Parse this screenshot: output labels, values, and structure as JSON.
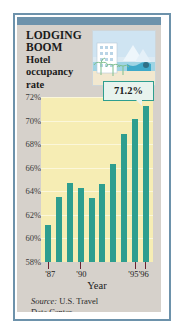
{
  "card": {
    "title_line1": "LODGING",
    "title_line2": "BOOM",
    "subtitle_line1": "Hotel",
    "subtitle_line2": "occupancy",
    "subtitle_line3": "rate",
    "illustration_name": "hotel-beach-illustration",
    "callout_value": "71.2%",
    "source_prefix": "Source:",
    "source_text": "U.S. Travel",
    "source_text2": "Data Center"
  },
  "colors": {
    "bar": "#2e9e8f",
    "plot_background": "#f6edb4",
    "card_background": "#d6d1cb",
    "frame": "#6d92ab",
    "gridline": "#fbf7da",
    "tick": "#6b2230",
    "callout_background": "#e8f3ee"
  },
  "chart_data": {
    "type": "bar",
    "title": "LODGING BOOM",
    "subtitle": "Hotel occupancy rate",
    "xlabel": "Year",
    "ylabel": "",
    "categories": [
      "'87",
      "'88",
      "'89",
      "'90",
      "'91",
      "'92",
      "'93",
      "'94",
      "'95",
      "'96"
    ],
    "values": [
      61.1,
      63.5,
      64.7,
      64.3,
      63.4,
      64.6,
      66.3,
      68.9,
      70.1,
      71.2
    ],
    "ylim": [
      58,
      72
    ],
    "ytick_labels": [
      "72%",
      "70%",
      "68%",
      "66%",
      "64%",
      "62%",
      "60%",
      "58%"
    ],
    "ytick_values": [
      72,
      70,
      68,
      66,
      64,
      62,
      60,
      58
    ],
    "xtick_labels": [
      "'87",
      "'90",
      "'95",
      "'96"
    ],
    "xtick_indices": [
      0,
      3,
      8,
      9
    ],
    "grid": true,
    "legend": "none",
    "annotations": [
      {
        "label": "71.2%",
        "category": "'96",
        "value": 71.2
      }
    ],
    "source": "Source: U.S. Travel Data Center"
  }
}
